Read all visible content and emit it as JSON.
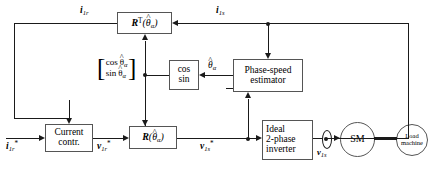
{
  "diagram": {
    "type": "control-block-diagram",
    "colors": {
      "line": "#1a1a1a",
      "box_border": "#555555",
      "background": "#ffffff"
    },
    "blocks": [
      {
        "id": "rot-transpose",
        "label": "R^T(theta_hat_alpha)",
        "shape": "rect",
        "kind": "math"
      },
      {
        "id": "phase-speed-estimator",
        "line1": "Phase-speed",
        "line2": "estimator",
        "shape": "rect"
      },
      {
        "id": "cos-sin",
        "line1": "cos",
        "line2": "sin",
        "shape": "rect"
      },
      {
        "id": "current-controller",
        "line1": "Current",
        "line2": "contr.",
        "shape": "rect"
      },
      {
        "id": "rotation-matrix",
        "label": "R(theta_hat_alpha)",
        "shape": "rect",
        "kind": "math"
      },
      {
        "id": "ideal-inverter",
        "line1": "Ideal",
        "line2": "2-phase",
        "line3": "inverter",
        "shape": "rect"
      },
      {
        "id": "synchronous-machine",
        "label": "SM",
        "shape": "circle"
      },
      {
        "id": "load-machine",
        "line1": "Load",
        "line2": "machine",
        "shape": "circle"
      }
    ],
    "signals": [
      {
        "id": "i1r-feedback",
        "label": "i1r",
        "bold": true
      },
      {
        "id": "i1s-measured",
        "label": "i1s",
        "bold": true
      },
      {
        "id": "theta-hat-alpha",
        "label": "theta_hat_alpha"
      },
      {
        "id": "i1r-ref",
        "label": "i1r*",
        "bold": true
      },
      {
        "id": "v1r-ref",
        "label": "v1r*",
        "bold": true
      },
      {
        "id": "v1s-ref",
        "label": "v1s*",
        "bold": true
      },
      {
        "id": "v1s",
        "label": "v1s",
        "bold": true
      }
    ],
    "matrix": {
      "row1": "cos",
      "row2": "sin",
      "arg": "theta_hat_alpha"
    }
  }
}
